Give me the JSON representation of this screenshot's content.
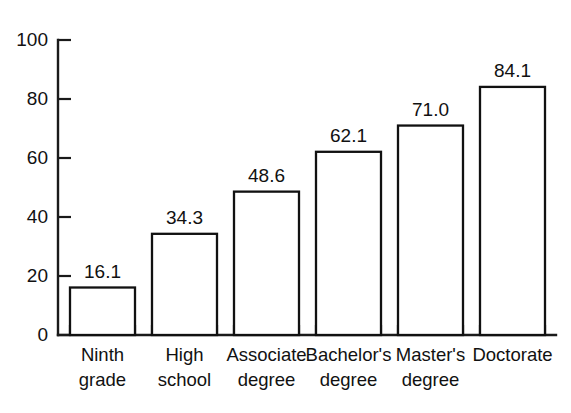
{
  "chart_data": {
    "type": "bar",
    "title": "",
    "subtitle": "",
    "xlabel": "",
    "ylabel": "",
    "ylim": [
      0,
      100
    ],
    "yticks": [
      0,
      20,
      40,
      60,
      80,
      100
    ],
    "ytick_labels": [
      "0",
      "20",
      "40",
      "60",
      "80",
      "100"
    ],
    "grid": false,
    "legend": false,
    "legend_position": "none",
    "categories": [
      "Ninth grade",
      "High school",
      "Associate degree",
      "Bachelor's degree",
      "Master's degree",
      "Doctorate"
    ],
    "category_lines": [
      [
        "Ninth",
        "grade"
      ],
      [
        "High",
        "school"
      ],
      [
        "Associate",
        "degree"
      ],
      [
        "Bachelor's",
        "degree"
      ],
      [
        "Master's",
        "degree"
      ],
      [
        "Doctorate",
        ""
      ]
    ],
    "values": [
      16.1,
      34.3,
      48.6,
      62.1,
      71.0,
      84.1
    ],
    "value_labels": [
      "16.1",
      "34.3",
      "48.6",
      "62.1",
      "71.0",
      "84.1"
    ],
    "bar_style": {
      "fill": "#ffffff",
      "stroke": "#111111"
    },
    "axis_color": "#1a1a1a",
    "background": "#ffffff"
  }
}
